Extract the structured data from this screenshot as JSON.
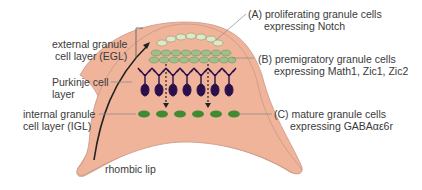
{
  "labels": {
    "egl": [
      "external granule",
      "cell layer (EGL)"
    ],
    "purkinje": [
      "Purkinje cell",
      "layer"
    ],
    "igl": [
      "internal granule",
      "cell layer (IGL)"
    ],
    "rhombic_lip": "rhombic lip",
    "a": [
      "(A) proliferating granule cells",
      "expressing Notch"
    ],
    "b": [
      "(B) premigratory granule cells",
      "expressing Math1, Zic1, Zic2"
    ],
    "c": [
      "(C) mature granule cells",
      "expressing GABAαε6r"
    ]
  },
  "colors": {
    "tissue": "#efb49a",
    "tissue_edge": "#b88a7a",
    "egl_outer": "#dfe8c8",
    "egl_inner": "#9cc08a",
    "purkinje": "#2a0f4a",
    "igl_cell": "#3f8a32"
  }
}
